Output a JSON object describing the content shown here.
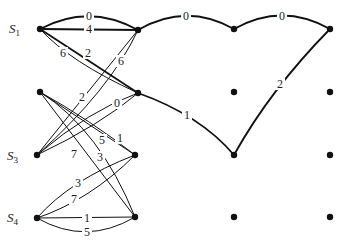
{
  "diagram": {
    "type": "trellis-graph",
    "stroke_color": "#111111",
    "background": "#ffffff",
    "state_labels": [
      {
        "id": "S1",
        "text": "S",
        "sub": "1",
        "x": 20,
        "y": 33
      },
      {
        "id": "S3",
        "text": "S",
        "sub": "3",
        "x": 18,
        "y": 160
      },
      {
        "id": "S4",
        "text": "S",
        "sub": "4",
        "x": 18,
        "y": 222
      }
    ],
    "nodes": [
      {
        "id": "c0r0",
        "x": 40,
        "y": 29
      },
      {
        "id": "c0r1",
        "x": 40,
        "y": 92
      },
      {
        "id": "c0r2",
        "x": 37,
        "y": 155
      },
      {
        "id": "c0r3",
        "x": 37,
        "y": 218
      },
      {
        "id": "c1r0",
        "x": 138,
        "y": 30
      },
      {
        "id": "c1r1",
        "x": 138,
        "y": 93
      },
      {
        "id": "c1r2",
        "x": 135,
        "y": 155
      },
      {
        "id": "c1r3",
        "x": 135,
        "y": 217
      },
      {
        "id": "c2r0",
        "x": 234,
        "y": 29
      },
      {
        "id": "c2r1",
        "x": 234,
        "y": 92
      },
      {
        "id": "c2r2",
        "x": 234,
        "y": 155
      },
      {
        "id": "c2r3",
        "x": 234,
        "y": 217
      },
      {
        "id": "c3r0",
        "x": 330,
        "y": 29
      },
      {
        "id": "c3r1",
        "x": 330,
        "y": 92
      },
      {
        "id": "c3r2",
        "x": 330,
        "y": 155
      },
      {
        "id": "c3r3",
        "x": 330,
        "y": 217
      }
    ],
    "edges": [
      {
        "from": "c0r0",
        "to": "c1r0",
        "label": "0",
        "path": "M40,29 Q89,3 138,30",
        "lx": 89,
        "ly": 20,
        "bold": true
      },
      {
        "from": "c0r0",
        "to": "c1r0",
        "label": "4",
        "path": "M40,29 L138,30",
        "lx": 89,
        "ly": 33,
        "bold": true
      },
      {
        "from": "c0r0",
        "to": "c1r1",
        "label": "6",
        "path": "M40,29 Q70,62 138,93",
        "lx": 63,
        "ly": 57,
        "bold": false
      },
      {
        "from": "c0r0",
        "to": "c1r1",
        "label": "2",
        "path": "M40,29 L138,93",
        "lx": 88,
        "ly": 57,
        "bold": true
      },
      {
        "from": "c0r2",
        "to": "c1r0",
        "label": "2",
        "path": "M37,155 L138,30",
        "lx": 82,
        "ly": 101,
        "bold": false
      },
      {
        "from": "c0r2",
        "to": "c1r0",
        "label": "6",
        "path": "M37,155 Q110,90 138,30",
        "lx": 121,
        "ly": 65,
        "bold": false
      },
      {
        "from": "c0r2",
        "to": "c1r1",
        "label": "0",
        "path": "M37,155 Q90,110 138,93",
        "lx": 117,
        "ly": 107,
        "bold": false
      },
      {
        "from": "c0r2",
        "to": "c1r1",
        "label": "",
        "path": "M37,155 Q100,125 138,93",
        "lx": 0,
        "ly": 0,
        "bold": false
      },
      {
        "from": "c0r1",
        "to": "c1r2",
        "label": "1",
        "path": "M40,92 L135,155",
        "lx": 120,
        "ly": 142,
        "bold": false
      },
      {
        "from": "c0r1",
        "to": "c1r2",
        "label": "5",
        "path": "M40,92 Q90,120 135,155",
        "lx": 102,
        "ly": 144,
        "bold": false
      },
      {
        "from": "c0r1",
        "to": "c1r3",
        "label": "7",
        "path": "M40,92 L135,217",
        "lx": 74,
        "ly": 158,
        "bold": false
      },
      {
        "from": "c0r1",
        "to": "c1r3",
        "label": "3",
        "path": "M40,92 Q100,130 135,217",
        "lx": 100,
        "ly": 161,
        "bold": false
      },
      {
        "from": "c0r3",
        "to": "c1r2",
        "label": "3",
        "path": "M37,218 Q70,180 135,155",
        "lx": 78,
        "ly": 187,
        "bold": false
      },
      {
        "from": "c0r3",
        "to": "c1r2",
        "label": "7",
        "path": "M37,218 Q90,200 135,155",
        "lx": 74,
        "ly": 203,
        "bold": false
      },
      {
        "from": "c0r3",
        "to": "c1r3",
        "label": "1",
        "path": "M37,218 L135,217",
        "lx": 87,
        "ly": 222,
        "bold": false
      },
      {
        "from": "c0r3",
        "to": "c1r3",
        "label": "5",
        "path": "M37,218 Q86,246 135,217",
        "lx": 87,
        "ly": 236,
        "bold": false
      },
      {
        "from": "c1r0",
        "to": "c2r0",
        "label": "0",
        "path": "M138,30 Q186,2 234,29",
        "lx": 186,
        "ly": 20,
        "bold": true
      },
      {
        "from": "c2r0",
        "to": "c3r0",
        "label": "0",
        "path": "M234,29 Q282,2 330,29",
        "lx": 282,
        "ly": 20,
        "bold": true
      },
      {
        "from": "c1r1",
        "to": "c2r2",
        "label": "1",
        "path": "M138,93 Q200,115 234,155",
        "lx": 187,
        "ly": 119,
        "bold": true
      },
      {
        "from": "c2r2",
        "to": "c3r0",
        "label": "2",
        "path": "M234,155 Q270,90 330,29",
        "lx": 280,
        "ly": 88,
        "bold": true
      }
    ]
  }
}
